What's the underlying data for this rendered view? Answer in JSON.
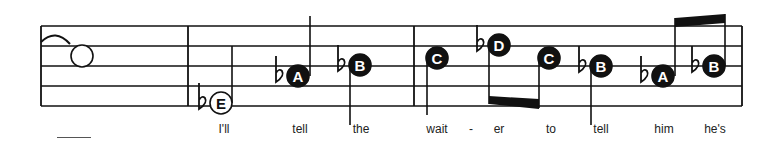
{
  "colors": {
    "ink": "#111111",
    "paper": "#ffffff",
    "note_label_filled": "#ffffff",
    "note_label_open": "#111111"
  },
  "staff": {
    "x_start": 41,
    "x_end": 742,
    "lines_y": [
      26,
      46,
      66,
      86,
      106
    ]
  },
  "barlines": [
    41,
    188,
    414,
    742
  ],
  "tie": {
    "x1": 41,
    "y1": 42,
    "x2": 70,
    "y2": 44,
    "ctrl_y": 28
  },
  "notes": [
    {
      "name": "whole-note",
      "x": 82,
      "y": 56,
      "letter": "",
      "filled": false,
      "flat": false,
      "stem": null
    },
    {
      "name": "note-e-flat",
      "x": 221,
      "y": 103,
      "letter": "E",
      "filled": false,
      "flat": true,
      "stem": {
        "dir": "up",
        "x": 232,
        "to": 46
      }
    },
    {
      "name": "note-a-flat",
      "x": 298,
      "y": 76,
      "letter": "A",
      "filled": true,
      "flat": true,
      "stem": {
        "dir": "up",
        "x": 310,
        "to": 16
      }
    },
    {
      "name": "note-b-flat",
      "x": 360,
      "y": 65,
      "letter": "B",
      "filled": true,
      "flat": true,
      "stem": {
        "dir": "down",
        "x": 350,
        "to": 125
      }
    },
    {
      "name": "note-c",
      "x": 437,
      "y": 58,
      "letter": "C",
      "filled": true,
      "flat": false,
      "stem": {
        "dir": "down",
        "x": 427,
        "to": 115
      }
    },
    {
      "name": "note-d-flat",
      "x": 499,
      "y": 45,
      "letter": "D",
      "filled": true,
      "flat": true,
      "stem": {
        "dir": "down",
        "x": 489,
        "to": 104
      }
    },
    {
      "name": "note-c",
      "x": 549,
      "y": 58,
      "letter": "C",
      "filled": true,
      "flat": false,
      "stem": {
        "dir": "down",
        "x": 539,
        "to": 108
      }
    },
    {
      "name": "note-b-flat",
      "x": 601,
      "y": 66,
      "letter": "B",
      "filled": true,
      "flat": true,
      "stem": {
        "dir": "down",
        "x": 591,
        "to": 125
      }
    },
    {
      "name": "note-a-flat",
      "x": 663,
      "y": 76,
      "letter": "A",
      "filled": true,
      "flat": true,
      "stem": {
        "dir": "up",
        "x": 675,
        "to": 18
      }
    },
    {
      "name": "note-b-flat",
      "x": 714,
      "y": 66,
      "letter": "B",
      "filled": true,
      "flat": true,
      "stem": {
        "dir": "up",
        "x": 725,
        "to": 14
      }
    }
  ],
  "beams": [
    {
      "name": "beam-d-c",
      "x1": 489,
      "y1a": 96,
      "y1b": 104,
      "x2": 539,
      "y2a": 99,
      "y2b": 109
    },
    {
      "name": "beam-a-b",
      "x1": 675,
      "y1a": 18,
      "y1b": 27,
      "x2": 725,
      "y2a": 14,
      "y2b": 23
    }
  ],
  "lyrics": [
    {
      "text": "I'll",
      "x": 224
    },
    {
      "text": "tell",
      "x": 300
    },
    {
      "text": "the",
      "x": 361
    },
    {
      "text": "wait",
      "x": 437
    },
    {
      "text": "-",
      "x": 471
    },
    {
      "text": "er",
      "x": 499
    },
    {
      "text": "to",
      "x": 551
    },
    {
      "text": "tell",
      "x": 601
    },
    {
      "text": "him",
      "x": 664
    },
    {
      "text": "he's",
      "x": 715
    }
  ],
  "extender_line": {
    "x": 57,
    "width": 34
  }
}
